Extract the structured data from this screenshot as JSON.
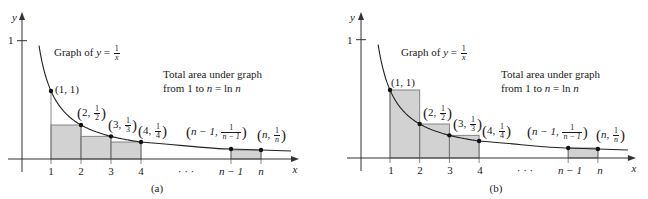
{
  "panels": [
    {
      "id": "a",
      "caption": "(a)",
      "mode": "lower",
      "origin_x": 22,
      "axis_y": 159,
      "unit_px": 30,
      "height_scale": 68,
      "title_prefix": "Graph of ",
      "title_var": "y",
      "title_eq": " = ",
      "title_num": "1",
      "title_den": "x",
      "area_line1": "Total area under graph",
      "area_line2_prefix": "from 1 to ",
      "area_line2_var": "n",
      "area_line2_mid": " = ln ",
      "area_line2_var2": "n",
      "y_axis_label": "y",
      "x_axis_label": "x",
      "y_tick_label": "1",
      "x_ticks": [
        "1",
        "2",
        "3",
        "4",
        "n − 1",
        "n"
      ],
      "ellipsis": "· · ·",
      "points": [
        {
          "label_x": "1",
          "label_y": "1",
          "frac": false
        },
        {
          "label_x": "2",
          "num": "1",
          "den": "2",
          "frac": true
        },
        {
          "label_x": "3",
          "num": "1",
          "den": "3",
          "frac": true
        },
        {
          "label_x": "4",
          "num": "1",
          "den": "4",
          "frac": true
        },
        {
          "label_x": "n − 1,",
          "num": "1",
          "den": "n − 1",
          "frac": true
        },
        {
          "label_x": "n,",
          "num": "1",
          "den": "n",
          "frac": true
        }
      ]
    },
    {
      "id": "b",
      "caption": "(b)",
      "mode": "upper",
      "origin_x": 361,
      "axis_y": 158,
      "unit_px": 29.7,
      "height_scale": 68,
      "title_prefix": "Graph of ",
      "title_var": "y",
      "title_eq": " = ",
      "title_num": "1",
      "title_den": "x",
      "area_line1": "Total area under graph",
      "area_line2_prefix": "from 1 to ",
      "area_line2_var": "n",
      "area_line2_mid": " = ln ",
      "area_line2_var2": "n",
      "y_axis_label": "y",
      "x_axis_label": "x",
      "y_tick_label": "1",
      "x_ticks": [
        "1",
        "2",
        "3",
        "4",
        "n − 1",
        "n"
      ],
      "ellipsis": "· · ·",
      "points": [
        {
          "label_x": "1",
          "label_y": "1",
          "frac": false
        },
        {
          "label_x": "2",
          "num": "1",
          "den": "2",
          "frac": true
        },
        {
          "label_x": "3",
          "num": "1",
          "den": "3",
          "frac": true
        },
        {
          "label_x": "4",
          "num": "1",
          "den": "4",
          "frac": true
        },
        {
          "label_x": "n − 1,",
          "num": "1",
          "den": "n − 1",
          "frac": true
        },
        {
          "label_x": "n,",
          "num": "1",
          "den": "n",
          "frac": true
        }
      ]
    }
  ],
  "colors": {
    "fill": "#d2d2d2",
    "rect_stroke": "#7a7a7a",
    "axis": "#333333",
    "curve": "#222222",
    "point": "#111111"
  }
}
